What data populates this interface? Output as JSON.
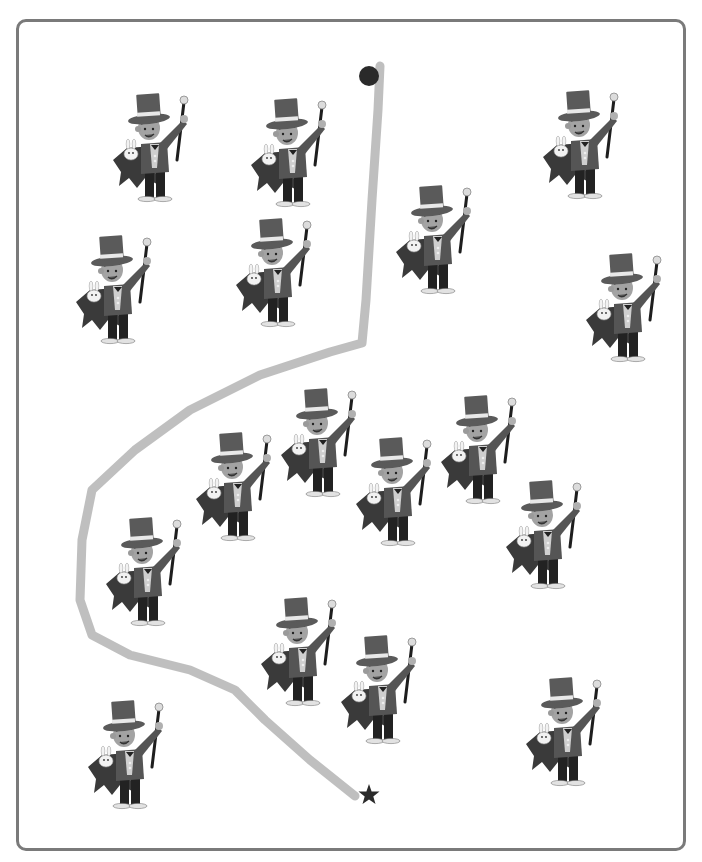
{
  "puzzle": {
    "type": "maze-path-through-magicians",
    "title_clipped": "",
    "start_marker": {
      "shape": "dot",
      "x": 369,
      "y": 76,
      "color": "#2a2a2a"
    },
    "end_marker": {
      "shape": "star",
      "x": 369,
      "y": 795,
      "color": "#2a2a2a"
    },
    "path": {
      "color": "#b8b8b8",
      "width": 9,
      "d": "M380 66 L378 110 L372 200 L366 300 L362 343 L330 352 L260 375 L190 410 L135 450 L92 490 L82 540 L80 600 L92 635 L130 655 L190 670 L235 690 L265 720 L310 760 L355 796"
    },
    "figure": {
      "name": "magician",
      "hat_color": "#5a5a5a",
      "hat_band_color": "#e8e8e8",
      "jacket_color": "#555555",
      "cape_color": "#3a3a3a",
      "skin_color": "#9a9a9a",
      "rabbit_color": "#f2f2f2",
      "trousers_color": "#222222"
    },
    "magicians": [
      {
        "id": 1,
        "x": 105,
        "y": 88
      },
      {
        "id": 2,
        "x": 243,
        "y": 93
      },
      {
        "id": 3,
        "x": 535,
        "y": 85
      },
      {
        "id": 4,
        "x": 388,
        "y": 180
      },
      {
        "id": 5,
        "x": 68,
        "y": 230
      },
      {
        "id": 6,
        "x": 228,
        "y": 213
      },
      {
        "id": 7,
        "x": 578,
        "y": 248
      },
      {
        "id": 8,
        "x": 273,
        "y": 383
      },
      {
        "id": 9,
        "x": 188,
        "y": 427
      },
      {
        "id": 10,
        "x": 433,
        "y": 390
      },
      {
        "id": 11,
        "x": 348,
        "y": 432
      },
      {
        "id": 12,
        "x": 498,
        "y": 475
      },
      {
        "id": 13,
        "x": 98,
        "y": 512
      },
      {
        "id": 14,
        "x": 253,
        "y": 592
      },
      {
        "id": 15,
        "x": 333,
        "y": 630
      },
      {
        "id": 16,
        "x": 518,
        "y": 672
      },
      {
        "id": 17,
        "x": 80,
        "y": 695
      }
    ],
    "magician_count": 17
  }
}
